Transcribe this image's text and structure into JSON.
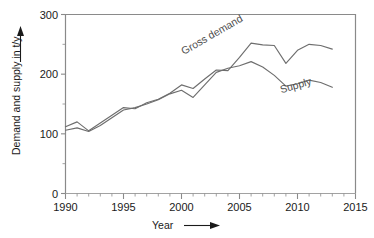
{
  "chart_data": {
    "type": "line",
    "title": "",
    "xlabel": "Year",
    "ylabel": "Demand and supply in t/y",
    "xlim": [
      1990,
      2015
    ],
    "ylim": [
      0,
      300
    ],
    "xticks": [
      1990,
      1995,
      2000,
      2005,
      2010,
      2015
    ],
    "yticks": [
      0,
      100,
      200,
      300
    ],
    "x_minor_tick_step": 1,
    "y_minor_tick_step": 50,
    "grid": false,
    "legend": "inline-annotations",
    "x": [
      1990,
      1991,
      1992,
      1993,
      1994,
      1995,
      1996,
      1997,
      1998,
      1999,
      2000,
      2001,
      2002,
      2003,
      2004,
      2005,
      2006,
      2007,
      2008,
      2009,
      2010,
      2011,
      2012,
      2013
    ],
    "series": [
      {
        "name": "Gross demand",
        "color": "#6e6e6e",
        "values": [
          112,
          120,
          105,
          118,
          131,
          144,
          142,
          152,
          158,
          168,
          182,
          176,
          192,
          207,
          206,
          228,
          252,
          249,
          248,
          218,
          240,
          250,
          248,
          242
        ]
      },
      {
        "name": "Supply",
        "color": "#6e6e6e",
        "values": [
          106,
          110,
          104,
          114,
          127,
          140,
          144,
          150,
          157,
          167,
          173,
          161,
          182,
          203,
          210,
          214,
          221,
          212,
          198,
          180,
          184,
          190,
          186,
          178
        ]
      }
    ],
    "annotations": [
      {
        "text": "Gross demand",
        "x": 2000.2,
        "y": 232,
        "rotation": -30
      },
      {
        "text": "Supply",
        "x": 2008.6,
        "y": 168,
        "rotation": -16
      }
    ],
    "axis_arrows": {
      "x_arrow": true,
      "y_arrow": true
    }
  },
  "tick_labels": {
    "x": [
      "1990",
      "1995",
      "2000",
      "2005",
      "2010",
      "2015"
    ],
    "y": [
      "0",
      "100",
      "200",
      "300"
    ]
  },
  "labels": {
    "x_axis_title": "Year",
    "y_axis_title": "Demand and supply in t/y",
    "series_gross_demand": "Gross demand",
    "series_supply": "Supply"
  },
  "colors": {
    "axis": "#8a8a8a",
    "line": "#6e6e6e",
    "text": "#1a1a1a",
    "annotation": "#4d4d4d",
    "background": "#ffffff"
  }
}
